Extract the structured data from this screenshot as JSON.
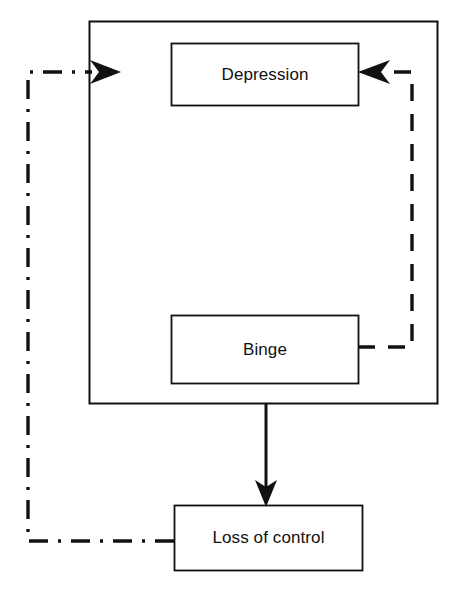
{
  "figure": {
    "type": "cycle-diagram",
    "title": "",
    "background_color": "#ffffff",
    "line_color": "#111111"
  },
  "nodes": {
    "container": {
      "label": "",
      "x": 89,
      "y": 21,
      "width": 348,
      "height": 382,
      "stroke_style": "solid"
    },
    "depression": {
      "label": "Depression",
      "x": 171,
      "y": 43,
      "width": 188,
      "height": 63,
      "stroke_style": "solid"
    },
    "binge": {
      "label": "Binge",
      "x": 171,
      "y": 315,
      "width": 188,
      "height": 69,
      "stroke_style": "solid"
    },
    "loss_of_control": {
      "label": "Loss of control",
      "x": 174,
      "y": 505,
      "width": 189,
      "height": 66,
      "stroke_style": "solid"
    }
  },
  "edges": [
    {
      "name": "container-to-loss-of-control",
      "from": "container",
      "to": "loss_of_control",
      "label": "",
      "stroke_style": "solid",
      "arrowhead": "filled-triangle",
      "direction": "down"
    },
    {
      "name": "binge-to-depression",
      "from": "binge",
      "to": "depression",
      "label": "",
      "stroke_style": "dashed",
      "arrowhead": "filled-barbed",
      "direction": "right-up-left"
    },
    {
      "name": "loss-of-control-to-container",
      "from": "loss_of_control",
      "to": "container",
      "label": "",
      "stroke_style": "dash-dot",
      "arrowhead": "filled-barbed",
      "direction": "left-up-right"
    }
  ]
}
